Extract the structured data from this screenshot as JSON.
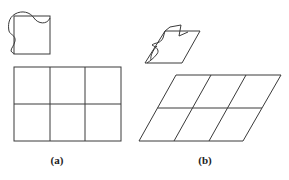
{
  "figure": {
    "panels": [
      {
        "label": "(a)",
        "description": "Small square with deformed wavy overlay above a rectangular 3x2 grid",
        "small_shape": {
          "type": "square",
          "x": 14,
          "y": 16,
          "w": 36,
          "h": 38
        },
        "grid": {
          "type": "rectangular",
          "cols": 3,
          "rows": 2,
          "x": 14,
          "y": 67,
          "w": 107,
          "h": 74
        }
      },
      {
        "label": "(b)",
        "description": "Small sheared parallelogram with deformed wavy overlay above a sheared 3x2 grid",
        "small_shape": {
          "type": "parallelogram",
          "top_left": [
            165,
            31
          ],
          "top_right": [
            200,
            31
          ],
          "bottom_left": [
            145,
            63
          ],
          "bottom_right": [
            182,
            63
          ]
        },
        "grid": {
          "type": "parallelogram",
          "cols": 3,
          "rows": 2,
          "top_left": [
            176,
            75
          ],
          "top_right": [
            281,
            75
          ],
          "bottom_left": [
            139,
            141
          ],
          "bottom_right": [
            243,
            141
          ]
        }
      }
    ],
    "stroke_color": "#333333"
  }
}
